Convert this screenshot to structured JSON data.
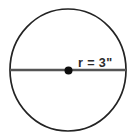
{
  "figure": {
    "kind": "geometry-diagram",
    "canvas": {
      "width": 136,
      "height": 138,
      "background_color": "#ffffff"
    },
    "circle": {
      "center_x": 68,
      "center_y": 70,
      "radius_x": 58,
      "radius_y": 61,
      "stroke_color": "#232323",
      "stroke_width": 1.7,
      "fill": "none"
    },
    "diameter_line": {
      "x1": 10,
      "y1": 70,
      "x2": 126,
      "y2": 70,
      "stroke_color": "#555555",
      "stroke_width": 2.6
    },
    "center_point": {
      "cx": 68.5,
      "cy": 70.5,
      "r": 4,
      "fill_color": "#0d0d0d"
    },
    "radius_label": {
      "text": "r = 3\"",
      "value": 3,
      "unit": "inches",
      "unit_symbol": "\"",
      "variable": "r",
      "x": 78,
      "y": 67,
      "font_size": 12.6,
      "color": "#2b2b2b"
    }
  }
}
